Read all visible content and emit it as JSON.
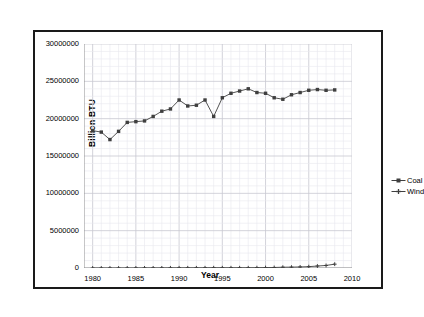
{
  "chart_data": {
    "type": "line",
    "title": "",
    "xlabel": "Year",
    "ylabel": "Billion BTU",
    "xlim": [
      1979,
      2010
    ],
    "ylim": [
      0,
      30000000
    ],
    "xticks": [
      1980,
      1985,
      1990,
      1995,
      2000,
      2005,
      2010
    ],
    "yticks": [
      0,
      5000000,
      10000000,
      15000000,
      20000000,
      25000000,
      30000000
    ],
    "grid": true,
    "legend_position": "right",
    "x": [
      1980,
      1981,
      1982,
      1983,
      1984,
      1985,
      1986,
      1987,
      1988,
      1989,
      1990,
      1991,
      1992,
      1993,
      1994,
      1995,
      1996,
      1997,
      1998,
      1999,
      2000,
      2001,
      2002,
      2003,
      2004,
      2005,
      2006,
      2007,
      2008
    ],
    "series": [
      {
        "name": "Coal",
        "marker": "square",
        "color": "#3f3f3f",
        "values": [
          18400000,
          18200000,
          17200000,
          18300000,
          19500000,
          19600000,
          19700000,
          20300000,
          21000000,
          21300000,
          22500000,
          21700000,
          21800000,
          22500000,
          20300000,
          22800000,
          23400000,
          23700000,
          24000000,
          23500000,
          23400000,
          22800000,
          22600000,
          23200000,
          23500000,
          23800000,
          23900000,
          23800000,
          23850000
        ]
      },
      {
        "name": "Wind",
        "marker": "cross",
        "color": "#3f3f3f",
        "values": [
          0,
          0,
          0,
          0,
          2000,
          6000,
          9000,
          11000,
          12000,
          20000,
          23000,
          25000,
          27000,
          29000,
          35000,
          33000,
          33000,
          34000,
          31000,
          46000,
          57000,
          70000,
          105000,
          115000,
          142000,
          178000,
          264000,
          341000,
          514000
        ]
      }
    ]
  },
  "legend": {
    "items": [
      {
        "label": "Coal"
      },
      {
        "label": "Wind"
      }
    ]
  }
}
